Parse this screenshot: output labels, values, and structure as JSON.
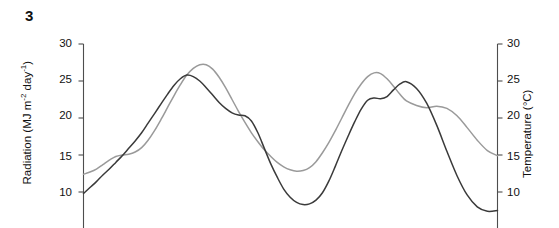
{
  "panel": {
    "label": "3"
  },
  "chart_data": {
    "type": "line",
    "title": "",
    "subtitle": "",
    "xlabel": "",
    "ylabel": "Radiation (MJ m-2 day-1)",
    "y2label": "Temperature (°C)",
    "ylim": [
      5,
      30
    ],
    "y2lim": [
      5,
      30
    ],
    "yticks": [
      10,
      15,
      20,
      25,
      30
    ],
    "y2ticks": [
      10,
      15,
      20,
      25,
      30
    ],
    "grid": false,
    "legend": "none",
    "axis_labels": {
      "left_title_main": "Radiation (MJ m",
      "left_sup_1": "-2",
      "left_title_mid": " day",
      "left_sup_2": "-1",
      "left_title_end": ")",
      "right_title": "Temperature (°C)"
    },
    "tick_text": {
      "left": [
        "30",
        "25",
        "20",
        "15",
        "10"
      ],
      "right": [
        "30",
        "25",
        "20",
        "15",
        "10"
      ]
    },
    "series": [
      {
        "name": "Radiation",
        "color": "#3a3a3a",
        "x": [
          0,
          2,
          4,
          6,
          8,
          10,
          12,
          14,
          16,
          18,
          20,
          22,
          24,
          26,
          28,
          30,
          32,
          34,
          36,
          38,
          40,
          42,
          44,
          46,
          48,
          50,
          52,
          54,
          56,
          58,
          60,
          62,
          64,
          66,
          68,
          70,
          72,
          74,
          76,
          78,
          80,
          82,
          84,
          86,
          88,
          90,
          92,
          94,
          96,
          98,
          100
        ],
        "values": [
          9.8,
          10.6,
          11.4,
          12.3,
          13.1,
          14.0,
          14.9,
          15.9,
          16.9,
          18.0,
          19.3,
          20.6,
          21.9,
          23.2,
          24.4,
          25.3,
          25.8,
          25.6,
          25.0,
          24.1,
          23.1,
          22.1,
          21.3,
          20.7,
          20.4,
          20.3,
          19.6,
          18.0,
          15.9,
          13.8,
          12.0,
          10.4,
          9.3,
          8.6,
          8.3,
          8.4,
          8.9,
          9.9,
          11.5,
          13.5,
          15.6,
          17.6,
          19.5,
          21.2,
          22.4,
          22.7,
          22.6,
          22.9,
          23.8,
          24.6,
          24.9
        ]
      },
      {
        "name": "Temperature",
        "color": "#9a9a9a",
        "x": [
          0,
          2,
          4,
          6,
          8,
          10,
          12,
          14,
          16,
          18,
          20,
          22,
          24,
          26,
          28,
          30,
          32,
          34,
          36,
          38,
          40,
          42,
          44,
          46,
          48,
          50,
          52,
          54,
          56,
          58,
          60,
          62,
          64,
          66,
          68,
          70,
          72,
          74,
          76,
          78,
          80,
          82,
          84,
          86,
          88,
          90,
          92,
          94,
          96,
          98,
          100
        ],
        "values": [
          12.4,
          12.7,
          13.1,
          13.7,
          14.3,
          14.8,
          15.0,
          15.1,
          15.4,
          16.0,
          17.0,
          18.3,
          19.8,
          21.4,
          23.0,
          24.5,
          25.8,
          26.7,
          27.2,
          27.2,
          26.6,
          25.5,
          24.1,
          22.5,
          20.9,
          19.4,
          18.0,
          16.8,
          15.7,
          14.8,
          14.0,
          13.4,
          13.0,
          12.8,
          12.9,
          13.3,
          14.1,
          15.3,
          16.7,
          18.3,
          20.0,
          21.7,
          23.3,
          24.6,
          25.6,
          26.1,
          26.0,
          25.3,
          24.3,
          23.2,
          22.3
        ]
      }
    ],
    "series_tail": {
      "radiation": [
        24.9,
        24.0,
        22.0,
        19.0,
        15.5,
        12.2,
        9.6,
        8.0,
        7.4,
        7.5
      ],
      "temperature": [
        22.3,
        21.7,
        21.4,
        21.6,
        21.3,
        20.3,
        18.7,
        17.0,
        15.6,
        14.9
      ]
    }
  }
}
